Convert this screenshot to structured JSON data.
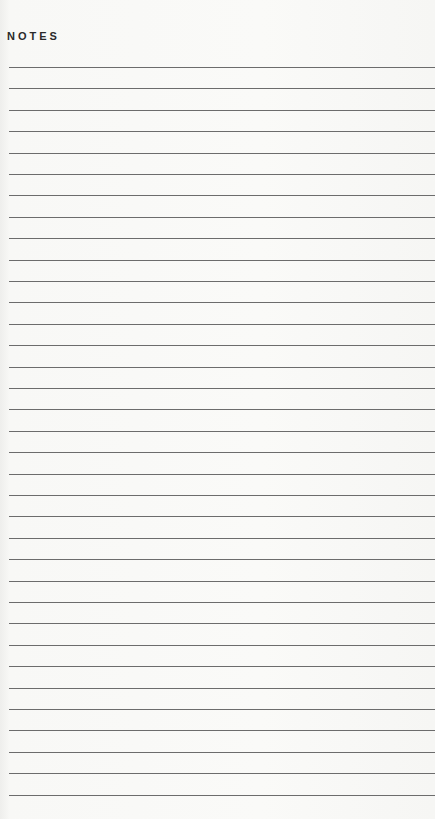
{
  "page": {
    "title": "NOTES",
    "line_count": 35,
    "line_spacing_px": 21.4,
    "line_color": "#6c6c6c",
    "background_color": "#f8f8f6"
  }
}
